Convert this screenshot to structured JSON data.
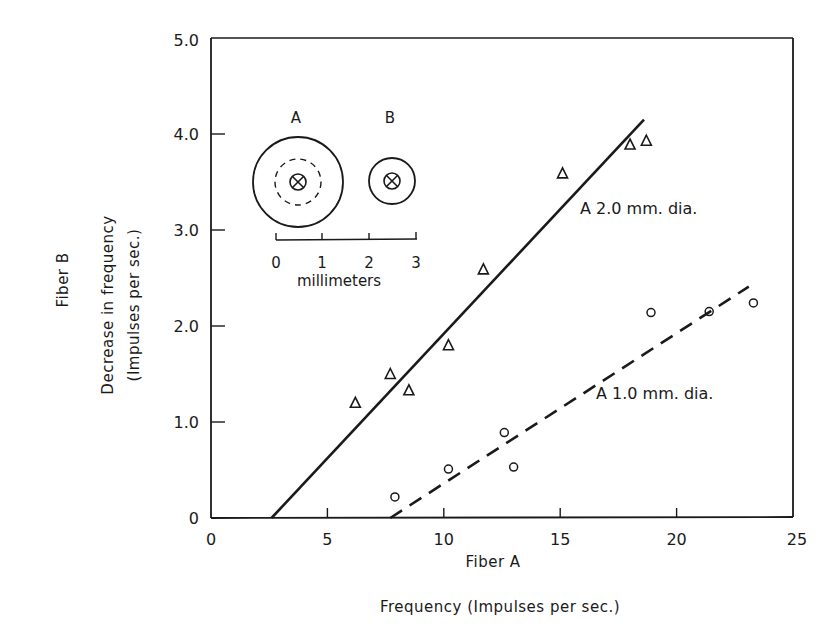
{
  "chart_data": {
    "type": "scatter",
    "title": "",
    "xlabel_inner": "Fiber A",
    "xlabel_outer": "Frequency (Impulses per sec.)",
    "ylabel_outer": "Fiber B",
    "ylabel_inner_line1": "Decrease in frequency",
    "ylabel_inner_line2": "(Impulses per sec.)",
    "xlim": [
      0,
      25
    ],
    "ylim": [
      0,
      5.0
    ],
    "x_ticks": [
      0,
      5,
      10,
      15,
      20,
      25
    ],
    "x_tick_labels": [
      "0",
      "5",
      "10",
      "15",
      "20",
      "25"
    ],
    "y_ticks": [
      0,
      1.0,
      2.0,
      3.0,
      4.0,
      5.0
    ],
    "y_tick_labels": [
      "0",
      "1.0",
      "2.0",
      "3.0",
      "4.0",
      "5.0"
    ],
    "grid": false,
    "series": [
      {
        "name": "A 2.0 mm. dia.",
        "marker": "triangle",
        "points": [
          {
            "x": 6.2,
            "y": 1.2
          },
          {
            "x": 7.7,
            "y": 1.5
          },
          {
            "x": 8.5,
            "y": 1.33
          },
          {
            "x": 10.2,
            "y": 1.8
          },
          {
            "x": 11.7,
            "y": 2.59
          },
          {
            "x": 15.1,
            "y": 3.59
          },
          {
            "x": 18.0,
            "y": 3.89
          },
          {
            "x": 18.7,
            "y": 3.93
          }
        ],
        "fit_line": {
          "style": "solid",
          "from": {
            "x": 2.6,
            "y": 0
          },
          "to": {
            "x": 18.6,
            "y": 4.15
          }
        },
        "label": "A 2.0 mm. dia."
      },
      {
        "name": "A 1.0 mm. dia.",
        "marker": "circle",
        "points": [
          {
            "x": 7.9,
            "y": 0.22
          },
          {
            "x": 10.2,
            "y": 0.51
          },
          {
            "x": 12.6,
            "y": 0.89
          },
          {
            "x": 13.0,
            "y": 0.53
          },
          {
            "x": 18.9,
            "y": 2.14
          },
          {
            "x": 21.4,
            "y": 2.15
          },
          {
            "x": 23.3,
            "y": 2.24
          }
        ],
        "fit_line": {
          "style": "dashed",
          "from": {
            "x": 7.7,
            "y": 0
          },
          "to": {
            "x": 23.1,
            "y": 2.41
          }
        },
        "label": "A 1.0 mm. dia."
      }
    ],
    "inset": {
      "label_a": "A",
      "label_b": "B",
      "scale_ticks": [
        "0",
        "1",
        "2",
        "3"
      ],
      "scale_unit": "millimeters"
    }
  }
}
